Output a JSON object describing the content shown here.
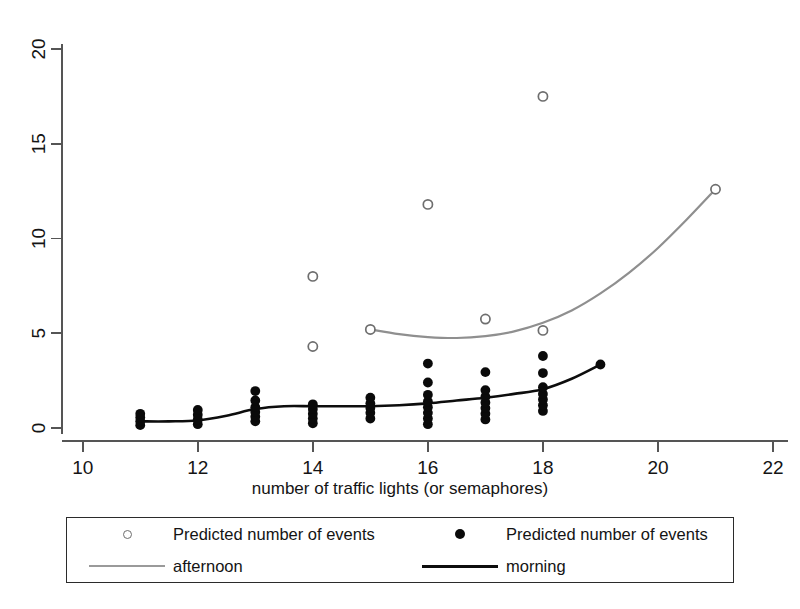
{
  "chart_data": {
    "type": "scatter",
    "title": "",
    "xlabel": "number of traffic lights (or semaphores)",
    "ylabel": "",
    "xlim": [
      9.64,
      22.26
    ],
    "ylim": [
      -0.6,
      21.2
    ],
    "xticks": [
      10,
      12,
      14,
      16,
      18,
      20,
      22
    ],
    "yticks": [
      0,
      5,
      10,
      15,
      20
    ],
    "xtick_labels": [
      "10",
      "12",
      "14",
      "16",
      "18",
      "20",
      "22"
    ],
    "ytick_labels": [
      "0",
      "5",
      "10",
      "15",
      "20"
    ],
    "grid": false,
    "legend_position": "below-axes",
    "series": [
      {
        "name": "afternoon",
        "legend_marker_label": "Predicted number of events",
        "legend_line_label": "afternoon",
        "marker": "open-circle",
        "color": "#8f8f8f",
        "points": [
          {
            "x": 14,
            "y": 8.0
          },
          {
            "x": 14,
            "y": 4.3
          },
          {
            "x": 15,
            "y": 5.2
          },
          {
            "x": 16,
            "y": 11.8
          },
          {
            "x": 17,
            "y": 5.75
          },
          {
            "x": 18,
            "y": 17.5
          },
          {
            "x": 18,
            "y": 5.15
          },
          {
            "x": 21,
            "y": 12.6
          }
        ],
        "fit_line": [
          {
            "x": 15.0,
            "y": 5.2
          },
          {
            "x": 15.5,
            "y": 4.95
          },
          {
            "x": 16.0,
            "y": 4.8
          },
          {
            "x": 16.5,
            "y": 4.75
          },
          {
            "x": 17.0,
            "y": 4.85
          },
          {
            "x": 17.5,
            "y": 5.1
          },
          {
            "x": 18.0,
            "y": 5.55
          },
          {
            "x": 18.5,
            "y": 6.2
          },
          {
            "x": 19.0,
            "y": 7.1
          },
          {
            "x": 19.5,
            "y": 8.2
          },
          {
            "x": 20.0,
            "y": 9.5
          },
          {
            "x": 20.5,
            "y": 11.0
          },
          {
            "x": 21.0,
            "y": 12.6
          }
        ]
      },
      {
        "name": "morning",
        "legend_marker_label": "Predicted number of events",
        "legend_line_label": "morning",
        "marker": "filled-circle",
        "color": "#0a0a0a",
        "points": [
          {
            "x": 11,
            "y": 0.15
          },
          {
            "x": 11,
            "y": 0.35
          },
          {
            "x": 11,
            "y": 0.55
          },
          {
            "x": 11,
            "y": 0.75
          },
          {
            "x": 12,
            "y": 0.2
          },
          {
            "x": 12,
            "y": 0.45
          },
          {
            "x": 12,
            "y": 0.7
          },
          {
            "x": 12,
            "y": 0.95
          },
          {
            "x": 13,
            "y": 0.35
          },
          {
            "x": 13,
            "y": 0.6
          },
          {
            "x": 13,
            "y": 0.85
          },
          {
            "x": 13,
            "y": 1.1
          },
          {
            "x": 13,
            "y": 1.45
          },
          {
            "x": 13,
            "y": 1.95
          },
          {
            "x": 14,
            "y": 0.25
          },
          {
            "x": 14,
            "y": 0.5
          },
          {
            "x": 14,
            "y": 0.75
          },
          {
            "x": 14,
            "y": 1.0
          },
          {
            "x": 14,
            "y": 1.25
          },
          {
            "x": 15,
            "y": 0.5
          },
          {
            "x": 15,
            "y": 0.8
          },
          {
            "x": 15,
            "y": 1.05
          },
          {
            "x": 15,
            "y": 1.3
          },
          {
            "x": 15,
            "y": 1.6
          },
          {
            "x": 16,
            "y": 0.2
          },
          {
            "x": 16,
            "y": 0.5
          },
          {
            "x": 16,
            "y": 0.8
          },
          {
            "x": 16,
            "y": 1.1
          },
          {
            "x": 16,
            "y": 1.4
          },
          {
            "x": 16,
            "y": 1.75
          },
          {
            "x": 16,
            "y": 2.4
          },
          {
            "x": 16,
            "y": 3.4
          },
          {
            "x": 17,
            "y": 0.45
          },
          {
            "x": 17,
            "y": 0.75
          },
          {
            "x": 17,
            "y": 1.05
          },
          {
            "x": 17,
            "y": 1.35
          },
          {
            "x": 17,
            "y": 1.65
          },
          {
            "x": 17,
            "y": 2.0
          },
          {
            "x": 17,
            "y": 2.95
          },
          {
            "x": 18,
            "y": 0.9
          },
          {
            "x": 18,
            "y": 1.2
          },
          {
            "x": 18,
            "y": 1.5
          },
          {
            "x": 18,
            "y": 1.8
          },
          {
            "x": 18,
            "y": 2.15
          },
          {
            "x": 18,
            "y": 2.9
          },
          {
            "x": 18,
            "y": 3.8
          },
          {
            "x": 19,
            "y": 3.35
          }
        ],
        "fit_line": [
          {
            "x": 11.0,
            "y": 0.35
          },
          {
            "x": 11.5,
            "y": 0.35
          },
          {
            "x": 12.0,
            "y": 0.4
          },
          {
            "x": 12.5,
            "y": 0.65
          },
          {
            "x": 13.0,
            "y": 1.0
          },
          {
            "x": 13.5,
            "y": 1.15
          },
          {
            "x": 14.0,
            "y": 1.15
          },
          {
            "x": 14.5,
            "y": 1.15
          },
          {
            "x": 15.0,
            "y": 1.15
          },
          {
            "x": 15.5,
            "y": 1.2
          },
          {
            "x": 16.0,
            "y": 1.3
          },
          {
            "x": 16.5,
            "y": 1.45
          },
          {
            "x": 17.0,
            "y": 1.6
          },
          {
            "x": 17.5,
            "y": 1.8
          },
          {
            "x": 18.0,
            "y": 2.05
          },
          {
            "x": 18.5,
            "y": 2.6
          },
          {
            "x": 19.0,
            "y": 3.35
          }
        ]
      }
    ]
  },
  "legend": {
    "rows": [
      {
        "left_key": "open-circle-marker",
        "left_label": "Predicted number of events",
        "right_key": "filled-circle-marker",
        "right_label": "Predicted number of events"
      },
      {
        "left_key": "gray-line",
        "left_label": "afternoon",
        "right_key": "black-line",
        "right_label": "morning"
      }
    ]
  },
  "colors": {
    "afternoon": "#8f8f8f",
    "morning": "#0a0a0a",
    "axis": "#555555",
    "background": "#ffffff"
  }
}
